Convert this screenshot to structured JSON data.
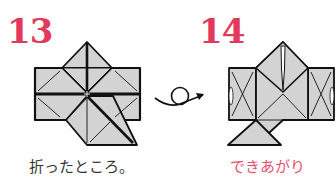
{
  "steps": [
    {
      "number": "13",
      "caption": "折ったところ。",
      "caption_color": "#333333"
    },
    {
      "number": "14",
      "caption": "できあがり",
      "caption_color": "#e8506e"
    }
  ],
  "colors": {
    "step_number": "#e23a5c",
    "paper_fill": "#d3d3d3",
    "outline": "#111111"
  },
  "symbols": {
    "turn_over_arrow": "turn-over"
  }
}
